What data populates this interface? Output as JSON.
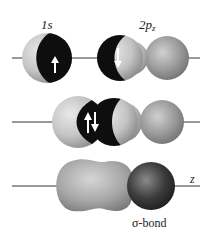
{
  "diagram": {
    "rows": [
      {
        "id": "separate-orbitals",
        "orbitals": [
          {
            "label": "1s",
            "spin": "up",
            "arrow": "↑"
          },
          {
            "label": "2p",
            "subscript": "z",
            "spin": "down",
            "arrow": "↓"
          }
        ]
      },
      {
        "id": "overlapping-orbitals",
        "paired_spins": "↑↓"
      },
      {
        "id": "sigma-bond",
        "axis_label": "z",
        "bond_label": "σ-bond"
      }
    ],
    "colors": {
      "light_lobe": "#c8c8c8",
      "dark_region": "#111111",
      "gray_lobe": "#9a9a9a",
      "dark_lobe": "#3a3a3a",
      "axis_line": "#333333"
    }
  },
  "labels": {
    "s1": "1s",
    "p2": "2p",
    "p2_sub": "z",
    "z_axis": "z",
    "sigma": "σ-bond"
  }
}
